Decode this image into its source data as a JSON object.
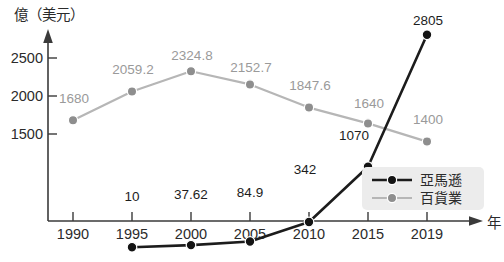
{
  "chart_data": {
    "type": "line",
    "title": "",
    "ylabel": "億（美元）",
    "xlabel": "年",
    "x": [
      1990,
      1995,
      2000,
      2005,
      2010,
      2015,
      2019
    ],
    "categories": [
      "1990",
      "1995",
      "2000",
      "2005",
      "2010",
      "2015",
      "2019"
    ],
    "ylim": [
      0,
      2900
    ],
    "yticks": [
      1500,
      2000,
      2500
    ],
    "ytick_labels": [
      "1500",
      "2000",
      "2500"
    ],
    "grid": false,
    "legend_position": "bottom-right",
    "series": [
      {
        "name": "亞馬遜",
        "color": "#1c1c1c",
        "x": [
          1995,
          2000,
          2005,
          2010,
          2015,
          2019
        ],
        "values": [
          10,
          37.62,
          84.9,
          342,
          1070,
          2805
        ],
        "labels": [
          "10",
          "37.62",
          "84.9",
          "342",
          "1070",
          "2805"
        ]
      },
      {
        "name": "百貨業",
        "color": "#9a9a9a",
        "x": [
          1990,
          1995,
          2000,
          2005,
          2010,
          2015,
          2019
        ],
        "values": [
          1680,
          2059.2,
          2324.8,
          2152.7,
          1847.6,
          1640,
          1400
        ],
        "labels": [
          "1680",
          "2059.2",
          "2324.8",
          "2152.7",
          "1847.6",
          "1640",
          "1400"
        ]
      }
    ]
  },
  "axis": {
    "y_unit_label": "億（美元）",
    "x_unit_label": "年",
    "ytick_0": "2500",
    "ytick_1": "2000",
    "ytick_2": "1500",
    "xtick_0": "1990",
    "xtick_1": "1995",
    "xtick_2": "2000",
    "xtick_3": "2005",
    "xtick_4": "2010",
    "xtick_5": "2015",
    "xtick_6": "2019"
  },
  "legend": {
    "entry_0": "亞馬遜",
    "entry_1": "百貨業"
  },
  "labels": {
    "amazon_1995": "10",
    "amazon_2000": "37.62",
    "amazon_2005": "84.9",
    "amazon_2010": "342",
    "amazon_2015": "1070",
    "amazon_2019": "2805",
    "dept_1990": "1680",
    "dept_1995": "2059.2",
    "dept_2000": "2324.8",
    "dept_2005": "2152.7",
    "dept_2010": "1847.6",
    "dept_2015": "1640",
    "dept_2019": "1400"
  },
  "caption": {
    "text": ""
  }
}
